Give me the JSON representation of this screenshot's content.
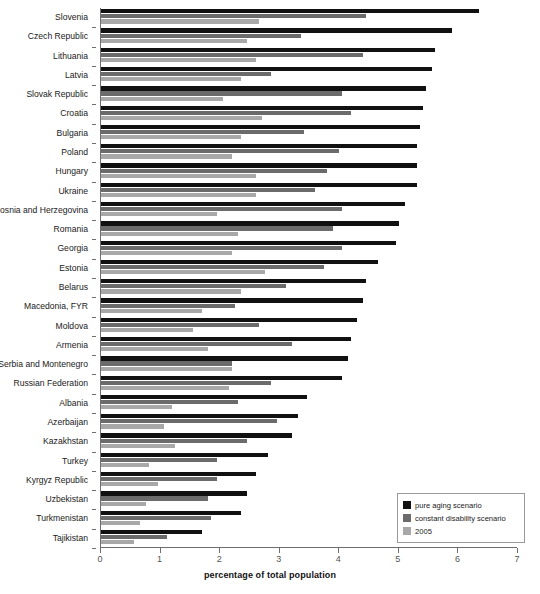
{
  "chart_data": {
    "type": "bar",
    "orientation": "horizontal",
    "title": "",
    "subtitle": "",
    "xlabel": "percentage of total population",
    "ylabel": "",
    "xlim": [
      0,
      7
    ],
    "xticks": [
      0,
      1,
      2,
      3,
      4,
      5,
      6,
      7
    ],
    "xticklabels": [
      "0",
      "1",
      "2",
      "3",
      "4",
      "5",
      "6",
      "7"
    ],
    "grid": false,
    "legend_position": "bottom-right",
    "legend": [
      "pure aging scenario",
      "constant disability scenario",
      "2005"
    ],
    "colors": {
      "pure aging scenario": "#111111",
      "constant disability scenario": "#6b6b6b",
      "2005": "#a8a8a8"
    },
    "categories": [
      "Slovenia",
      "Czech Republic",
      "Lithuania",
      "Latvia",
      "Slovak Republic",
      "Croatia",
      "Bulgaria",
      "Poland",
      "Hungary",
      "Ukraine",
      "Bosnia and Herzegovina",
      "Romania",
      "Georgia",
      "Estonia",
      "Belarus",
      "Macedonia, FYR",
      "Moldova",
      "Armenia",
      "Serbia and Montenegro",
      "Russian Federation",
      "Albania",
      "Azerbaijan",
      "Kazakhstan",
      "Turkey",
      "Kyrgyz Republic",
      "Uzbekistan",
      "Turkmenistan",
      "Tajikistan"
    ],
    "series": [
      {
        "name": "pure aging scenario",
        "values": [
          6.35,
          5.9,
          5.6,
          5.55,
          5.45,
          5.4,
          5.35,
          5.3,
          5.3,
          5.3,
          5.1,
          5.0,
          4.95,
          4.65,
          4.45,
          4.4,
          4.3,
          4.2,
          4.15,
          4.05,
          3.45,
          3.3,
          3.2,
          2.8,
          2.6,
          2.45,
          2.35,
          1.7
        ]
      },
      {
        "name": "constant disability scenario",
        "values": [
          4.45,
          3.35,
          4.4,
          2.85,
          4.05,
          4.2,
          3.4,
          4.0,
          3.8,
          3.6,
          4.05,
          3.9,
          4.05,
          3.75,
          3.1,
          2.25,
          2.65,
          3.2,
          2.2,
          2.85,
          2.3,
          2.95,
          2.45,
          1.95,
          1.95,
          1.8,
          1.85,
          1.1
        ]
      },
      {
        "name": "2005",
        "values": [
          2.65,
          2.45,
          2.6,
          2.35,
          2.05,
          2.7,
          2.35,
          2.2,
          2.6,
          2.6,
          1.95,
          2.3,
          2.2,
          2.75,
          2.35,
          1.7,
          1.55,
          1.8,
          2.2,
          2.15,
          1.2,
          1.05,
          1.25,
          0.8,
          0.95,
          0.75,
          0.65,
          0.55
        ]
      }
    ]
  },
  "axis": {
    "x_title": "percentage of total population"
  }
}
